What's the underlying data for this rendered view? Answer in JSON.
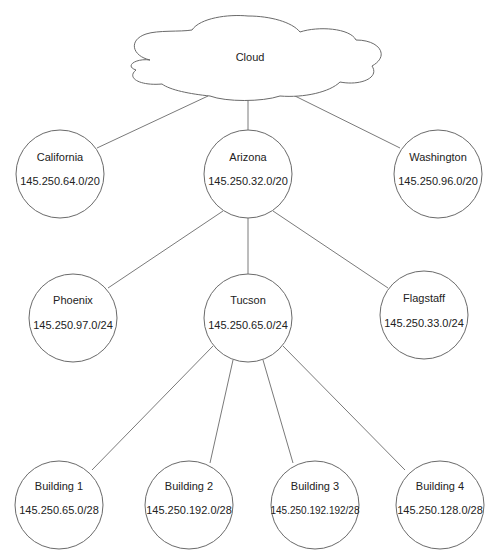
{
  "diagram": {
    "colors": {
      "line": "#7a7a7a",
      "node_stroke": "#6a6a6a",
      "node_fill": "#ffffff",
      "text": "#222222"
    },
    "cloud": {
      "label": "Cloud"
    },
    "nodes": {
      "california": {
        "name": "California",
        "subnet": "145.250.64.0/20"
      },
      "arizona": {
        "name": "Arizona",
        "subnet": "145.250.32.0/20"
      },
      "washington": {
        "name": "Washington",
        "subnet": "145.250.96.0/20"
      },
      "phoenix": {
        "name": "Phoenix",
        "subnet": "145.250.97.0/24"
      },
      "tucson": {
        "name": "Tucson",
        "subnet": "145.250.65.0/24"
      },
      "flagstaff": {
        "name": "Flagstaff",
        "subnet": "145.250.33.0/24"
      },
      "building1": {
        "name": "Building 1",
        "subnet": "145.250.65.0/28"
      },
      "building2": {
        "name": "Building 2",
        "subnet": "145.250.192.0/28"
      },
      "building3": {
        "name": "Building 3",
        "subnet": "145.250.192.192/28"
      },
      "building4": {
        "name": "Building 4",
        "subnet": "145.250.128.0/28"
      }
    },
    "edges": [
      [
        "cloud",
        "california"
      ],
      [
        "cloud",
        "arizona"
      ],
      [
        "cloud",
        "washington"
      ],
      [
        "arizona",
        "phoenix"
      ],
      [
        "arizona",
        "tucson"
      ],
      [
        "arizona",
        "flagstaff"
      ],
      [
        "tucson",
        "building1"
      ],
      [
        "tucson",
        "building2"
      ],
      [
        "tucson",
        "building3"
      ],
      [
        "tucson",
        "building4"
      ]
    ]
  }
}
